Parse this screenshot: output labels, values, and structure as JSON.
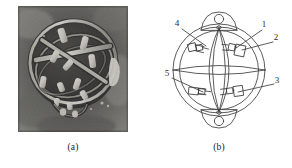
{
  "figure": {
    "panels": [
      {
        "id": "a",
        "caption": "(a)",
        "kind": "photograph",
        "subject": "spherical gimbal gyro assembly photograph",
        "description": "Grayscale close-up photograph of a dark spherical cage assembly with bright metallic struts and crossed bands"
      },
      {
        "id": "b",
        "caption": "(b)",
        "kind": "line-diagram",
        "subject": "schematic line drawing of the spherical gimbal assembly",
        "description": "Outline schematic showing two concentric outer rings, lens shaped inner meridian arcs, four rectangular fixture blocks and circular mounting bosses at top and bottom"
      }
    ]
  },
  "diagram": {
    "callouts": [
      {
        "id": "c1",
        "label": "1",
        "position": "top-right",
        "x": 118,
        "y": 27
      },
      {
        "id": "c2",
        "label": "2",
        "position": "right-upper",
        "x": 130,
        "y": 40
      },
      {
        "id": "c3",
        "label": "3",
        "position": "right-lower",
        "x": 131,
        "y": 83
      },
      {
        "id": "c4",
        "label": "4",
        "position": "top-left",
        "x": 31,
        "y": 26
      },
      {
        "id": "c5",
        "label": "5",
        "position": "left-lower",
        "x": 21,
        "y": 76
      }
    ],
    "features": {
      "outer_ring": "outer-ring",
      "inner_ring": "inner-ring",
      "meridian_arcs": "meridian-arcs",
      "top_boss": "top-mounting-boss",
      "bottom_boss": "bottom-mounting-boss",
      "fixture_blocks": 4
    },
    "colors": {
      "line": "#3a3a3a",
      "line_light": "#6e6e6e",
      "background": "#ffffff"
    }
  },
  "photo": {
    "colors": {
      "background_dark": "#3c3b39",
      "background_mid": "#6d6c68",
      "highlight": "#e8e6e0",
      "shadow": "#17171a"
    }
  }
}
